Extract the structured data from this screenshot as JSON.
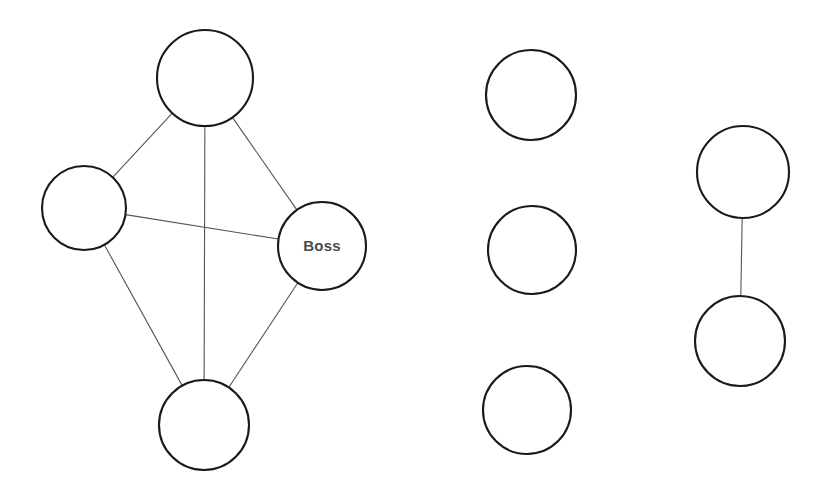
{
  "diagram": {
    "background_color": "#ffffff",
    "node_fill": "#ffffff",
    "node_stroke": "#1a1a1a",
    "node_stroke_width": 2.1,
    "edge_stroke": "#555555",
    "edge_stroke_width": 1.1,
    "label_color": "#4a4a4a",
    "label_font_size": 15,
    "components": [
      {
        "id": "component-clique",
        "name": "left-clique",
        "description": "fully connected group of four nodes",
        "node_count": 4,
        "edge_count": 6
      },
      {
        "id": "component-isolates",
        "name": "middle-isolates",
        "description": "three unconnected nodes",
        "node_count": 3,
        "edge_count": 0
      },
      {
        "id": "component-dyad",
        "name": "right-dyad",
        "description": "two nodes joined by a single tie",
        "node_count": 2,
        "edge_count": 1
      }
    ],
    "nodes": [
      {
        "id": "n1",
        "label": "",
        "cx": 205,
        "cy": 78,
        "r": 48,
        "component": "component-clique"
      },
      {
        "id": "n2",
        "label": "",
        "cx": 84,
        "cy": 208,
        "r": 42,
        "component": "component-clique"
      },
      {
        "id": "n3",
        "label": "Boss",
        "cx": 322,
        "cy": 246,
        "r": 44,
        "component": "component-clique"
      },
      {
        "id": "n4",
        "label": "",
        "cx": 204,
        "cy": 425,
        "r": 45,
        "component": "component-clique"
      },
      {
        "id": "n5",
        "label": "",
        "cx": 531,
        "cy": 95,
        "r": 45,
        "component": "component-isolates"
      },
      {
        "id": "n6",
        "label": "",
        "cx": 532,
        "cy": 250,
        "r": 44,
        "component": "component-isolates"
      },
      {
        "id": "n7",
        "label": "",
        "cx": 527,
        "cy": 410,
        "r": 44,
        "component": "component-isolates"
      },
      {
        "id": "n8",
        "label": "",
        "cx": 743,
        "cy": 172,
        "r": 46,
        "component": "component-dyad"
      },
      {
        "id": "n9",
        "label": "",
        "cx": 740,
        "cy": 341,
        "r": 45,
        "component": "component-dyad"
      }
    ],
    "edges": [
      {
        "id": "e1",
        "source": "n1",
        "target": "n2",
        "component": "component-clique"
      },
      {
        "id": "e2",
        "source": "n1",
        "target": "n3",
        "component": "component-clique"
      },
      {
        "id": "e3",
        "source": "n1",
        "target": "n4",
        "component": "component-clique"
      },
      {
        "id": "e4",
        "source": "n2",
        "target": "n3",
        "component": "component-clique"
      },
      {
        "id": "e5",
        "source": "n2",
        "target": "n4",
        "component": "component-clique"
      },
      {
        "id": "e6",
        "source": "n3",
        "target": "n4",
        "component": "component-clique"
      },
      {
        "id": "e7",
        "source": "n8",
        "target": "n9",
        "component": "component-dyad"
      }
    ]
  }
}
